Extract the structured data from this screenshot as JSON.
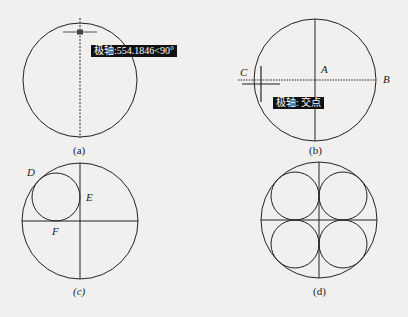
{
  "figures": {
    "a": {
      "caption": "(a)",
      "tooltip": "极轴:554.1846<90°"
    },
    "b": {
      "caption": "(b)",
      "tooltip": "极轴: 交点",
      "points": {
        "A": "A",
        "B": "B",
        "C": "C"
      }
    },
    "c": {
      "caption": "(c)",
      "points": {
        "D": "D",
        "E": "E",
        "F": "F"
      }
    },
    "d": {
      "caption": "(d)"
    }
  },
  "colors": {
    "line": "#222222",
    "tooltip_bg": "#111111",
    "tooltip_fg": "#ffffff",
    "background": "#f1f0ee"
  }
}
